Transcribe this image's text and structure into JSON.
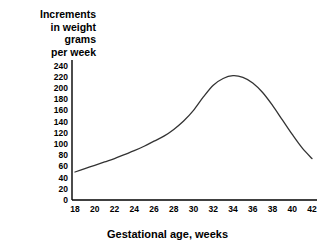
{
  "axis_titles": {
    "y": "Increments\nin weight\ngrams\nper week",
    "x": "Gestational age, weeks"
  },
  "colors": {
    "background": "#ffffff",
    "axis": "#000000",
    "curve": "#333333",
    "text": "#000000"
  },
  "chart_data": {
    "type": "line",
    "title": "",
    "subtitle": "",
    "xlabel": "Gestational age, weeks",
    "ylabel": "Increments in weight grams per week",
    "xlim": [
      17,
      42.5
    ],
    "ylim": [
      0,
      250
    ],
    "xticks": [
      18,
      20,
      22,
      24,
      26,
      28,
      30,
      32,
      34,
      36,
      38,
      40,
      42
    ],
    "yticks": [
      0,
      20,
      40,
      60,
      80,
      100,
      120,
      140,
      160,
      180,
      200,
      220,
      240
    ],
    "grid": false,
    "legend": "none",
    "series": [
      {
        "name": "Weight increment",
        "x": [
          18,
          19,
          20,
          21,
          22,
          23,
          24,
          25,
          26,
          27,
          28,
          29,
          30,
          31,
          32,
          33,
          34,
          35,
          36,
          37,
          38,
          39,
          40,
          41,
          42
        ],
        "values": [
          50,
          56,
          62,
          68,
          74,
          81,
          88,
          96,
          105,
          114,
          126,
          141,
          160,
          184,
          205,
          217,
          222,
          219,
          209,
          192,
          169,
          143,
          117,
          93,
          74
        ]
      }
    ],
    "annotations": [
      {
        "text": "peak",
        "x": 34,
        "y": 222
      }
    ]
  }
}
